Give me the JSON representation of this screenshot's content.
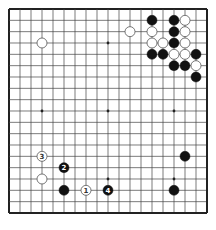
{
  "board": {
    "size": 19,
    "origin_x": 9,
    "origin_y": 9,
    "spacing_x": 11,
    "spacing_y": 11.333,
    "line_color": "#444444",
    "border_color": "#222222",
    "background": "#ffffff",
    "star_points": [
      [
        3,
        3
      ],
      [
        9,
        3
      ],
      [
        15,
        3
      ],
      [
        3,
        9
      ],
      [
        9,
        9
      ],
      [
        15,
        9
      ],
      [
        3,
        15
      ],
      [
        9,
        15
      ],
      [
        15,
        15
      ]
    ]
  },
  "colors": {
    "black_stone": "#111111",
    "white_stone": "#ffffff",
    "white_stone_stroke": "#555555"
  },
  "stones": [
    {
      "color": "black",
      "col": 13,
      "row": 1
    },
    {
      "color": "black",
      "col": 15,
      "row": 1
    },
    {
      "color": "white",
      "col": 16,
      "row": 1
    },
    {
      "color": "white",
      "col": 11,
      "row": 2
    },
    {
      "color": "white",
      "col": 13,
      "row": 2
    },
    {
      "color": "black",
      "col": 15,
      "row": 2
    },
    {
      "color": "white",
      "col": 16,
      "row": 2
    },
    {
      "color": "white",
      "col": 3,
      "row": 3
    },
    {
      "color": "white",
      "col": 13,
      "row": 3
    },
    {
      "color": "white",
      "col": 14,
      "row": 3
    },
    {
      "color": "black",
      "col": 15,
      "row": 3
    },
    {
      "color": "white",
      "col": 16,
      "row": 3
    },
    {
      "color": "black",
      "col": 13,
      "row": 4
    },
    {
      "color": "black",
      "col": 14,
      "row": 4
    },
    {
      "color": "white",
      "col": 15,
      "row": 4
    },
    {
      "color": "white",
      "col": 16,
      "row": 4
    },
    {
      "color": "black",
      "col": 17,
      "row": 4
    },
    {
      "color": "black",
      "col": 15,
      "row": 5
    },
    {
      "color": "black",
      "col": 16,
      "row": 5
    },
    {
      "color": "white",
      "col": 17,
      "row": 5
    },
    {
      "color": "black",
      "col": 17,
      "row": 6
    },
    {
      "color": "black",
      "col": 16,
      "row": 13
    },
    {
      "color": "white",
      "col": 3,
      "row": 15
    },
    {
      "color": "black",
      "col": 5,
      "row": 16
    },
    {
      "color": "black",
      "col": 15,
      "row": 16
    }
  ],
  "numbered_moves": [
    {
      "label": "1",
      "color": "white",
      "col": 7,
      "row": 16
    },
    {
      "label": "2",
      "color": "black",
      "col": 5,
      "row": 14
    },
    {
      "label": "3",
      "color": "white",
      "col": 3,
      "row": 13
    },
    {
      "label": "4",
      "color": "black",
      "col": 9,
      "row": 16
    }
  ]
}
